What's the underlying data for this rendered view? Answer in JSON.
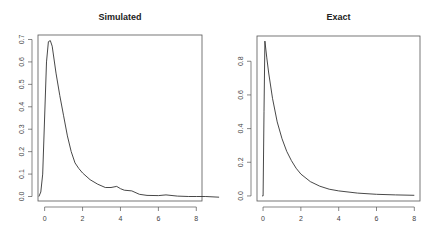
{
  "chart_data": [
    {
      "type": "line",
      "title": "Simulated",
      "xlabel": "",
      "ylabel": "",
      "xlim": [
        -0.35,
        8.3
      ],
      "ylim": [
        -0.02,
        0.72
      ],
      "grid": false,
      "legend": null,
      "x_ticks": [
        "0",
        "2",
        "4",
        "6",
        "8"
      ],
      "y_ticks": [
        "0.0",
        "0.1",
        "0.2",
        "0.3",
        "0.4",
        "0.5",
        "0.6",
        "0.7"
      ],
      "series": [
        {
          "name": "density",
          "x": [
            -0.3,
            -0.2,
            -0.1,
            0.0,
            0.1,
            0.2,
            0.3,
            0.4,
            0.6,
            0.8,
            1.0,
            1.2,
            1.4,
            1.6,
            1.8,
            2.0,
            2.4,
            2.8,
            3.2,
            3.5,
            3.8,
            4.0,
            4.2,
            4.6,
            5.0,
            5.4,
            6.0,
            6.4,
            7.0,
            7.6,
            8.0,
            8.5,
            9.2
          ],
          "y": [
            0.0,
            0.02,
            0.1,
            0.35,
            0.6,
            0.69,
            0.695,
            0.67,
            0.55,
            0.45,
            0.36,
            0.27,
            0.2,
            0.15,
            0.125,
            0.105,
            0.075,
            0.055,
            0.04,
            0.04,
            0.045,
            0.035,
            0.028,
            0.025,
            0.01,
            0.005,
            0.004,
            0.007,
            0.002,
            0.0,
            0.0,
            0.0,
            -0.003
          ]
        }
      ]
    },
    {
      "type": "line",
      "title": "Exact",
      "xlabel": "",
      "ylabel": "",
      "xlim": [
        -0.32,
        8.3
      ],
      "ylim": [
        -0.03,
        0.95
      ],
      "grid": false,
      "legend": null,
      "x_ticks": [
        "0",
        "2",
        "4",
        "6",
        "8"
      ],
      "y_ticks": [
        "0.0",
        "0.2",
        "0.4",
        "0.6",
        "0.8"
      ],
      "series": [
        {
          "name": "density",
          "x": [
            -0.05,
            0.0,
            0.05,
            0.1,
            0.2,
            0.3,
            0.5,
            0.75,
            1.0,
            1.25,
            1.5,
            1.75,
            2.0,
            2.5,
            3.0,
            3.5,
            4.0,
            5.0,
            6.0,
            7.0,
            8.0
          ],
          "y": [
            0.0,
            0.0,
            0.5,
            0.92,
            0.82,
            0.73,
            0.58,
            0.44,
            0.34,
            0.265,
            0.21,
            0.165,
            0.13,
            0.085,
            0.058,
            0.04,
            0.03,
            0.017,
            0.01,
            0.006,
            0.004
          ]
        }
      ]
    }
  ]
}
